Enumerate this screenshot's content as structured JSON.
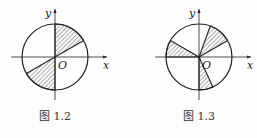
{
  "figures": [
    {
      "id": "fig-1-2",
      "caption": "图 1.2",
      "x_label": "x",
      "y_label": "y",
      "origin_label": "O",
      "shaded_sectors_deg": [
        [
          30,
          90
        ],
        [
          210,
          270
        ]
      ]
    },
    {
      "id": "fig-1-3",
      "caption": "图 1.3",
      "x_label": "x",
      "y_label": "y",
      "origin_label": "O",
      "shaded_sectors_deg": [
        [
          30,
          70
        ],
        [
          150,
          180
        ],
        [
          270,
          295
        ]
      ]
    }
  ],
  "colors": {
    "stroke": "#222222",
    "hatch": "#333333",
    "background": "#fdfdfd"
  }
}
